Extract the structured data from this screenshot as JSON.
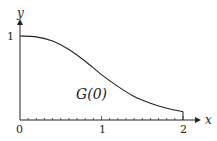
{
  "chart_data": {
    "type": "line",
    "title": "",
    "xlabel": "x",
    "ylabel": "y",
    "xlim": [
      0,
      2
    ],
    "ylim": [
      0,
      1
    ],
    "x_ticks": [
      "0",
      "1",
      "2"
    ],
    "y_ticks": [
      "1"
    ],
    "grid": false,
    "annotations": [
      "G(0)"
    ],
    "series": [
      {
        "name": "G(0)",
        "x": [
          0,
          0.2,
          0.4,
          0.6,
          0.8,
          1.0,
          1.2,
          1.4,
          1.6,
          1.8,
          2.0
        ],
        "values": [
          1.0,
          0.99,
          0.94,
          0.84,
          0.7,
          0.54,
          0.4,
          0.28,
          0.2,
          0.14,
          0.1
        ]
      }
    ]
  },
  "labels": {
    "x_axis": "x",
    "y_axis": "y",
    "origin": "0",
    "x_tick_1": "1",
    "x_tick_2": "2",
    "y_tick_1": "1",
    "curve_label": "G(0)"
  }
}
